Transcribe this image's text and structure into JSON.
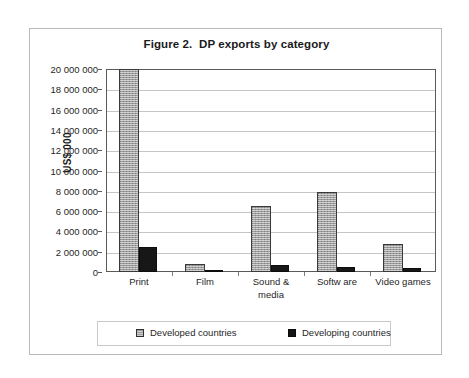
{
  "figure": {
    "frame_border_color": "#b9b9b9",
    "background_color": "#ffffff"
  },
  "chart_data": {
    "type": "bar",
    "title": "Figure 2.  DP exports by category",
    "xlabel": "",
    "ylabel": "US$ 000",
    "ylim": [
      0,
      20000000
    ],
    "ytick_step": 2000000,
    "grid": true,
    "legend_position": "bottom",
    "note": "Print / Developed countries bar is clipped at the top of the plot area (value at or above 20 000 000).",
    "categories": [
      "Print",
      "Film",
      "Sound & media",
      "Softw are",
      "Video games"
    ],
    "category_lines": [
      [
        "Print"
      ],
      [
        "Film"
      ],
      [
        "Sound &",
        "media"
      ],
      [
        "Softw are"
      ],
      [
        "Video games"
      ]
    ],
    "ytick_labels": [
      "20 000 000",
      "18 000 000",
      "16 000 000",
      "14 000 000",
      "12 000 000",
      "10 000 000",
      "8 000 000",
      "6 000 000",
      "4 000 000",
      "2 000 000",
      "0"
    ],
    "ytick_values": [
      20000000,
      18000000,
      16000000,
      14000000,
      12000000,
      10000000,
      8000000,
      6000000,
      4000000,
      2000000,
      0
    ],
    "series": [
      {
        "name": "Developed countries",
        "color": "#9d9d9d",
        "pattern": "hatched-gray",
        "values": [
          20000000,
          750000,
          6500000,
          7900000,
          2800000
        ]
      },
      {
        "name": "Developing countries",
        "color": "#171717",
        "pattern": "solid-black",
        "values": [
          2500000,
          230000,
          680000,
          480000,
          350000
        ]
      }
    ]
  },
  "legend": {
    "entries": [
      {
        "label": "Developed countries",
        "swatch": "developed"
      },
      {
        "label": "Developing countries",
        "swatch": "developing"
      }
    ]
  }
}
